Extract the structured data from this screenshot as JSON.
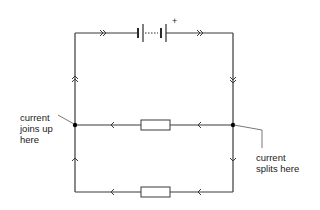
{
  "diagram": {
    "type": "parallel-circuit",
    "battery": {
      "polarity_label": "+"
    },
    "labels": {
      "joins": [
        "current",
        "joins up",
        "here"
      ],
      "splits": [
        "current",
        "splits here"
      ]
    },
    "components": [
      {
        "name": "battery",
        "branch": "main"
      },
      {
        "name": "resistor",
        "branch": "upper-parallel"
      },
      {
        "name": "resistor",
        "branch": "lower-parallel"
      }
    ],
    "current_arrows": {
      "main_wire": "double",
      "parallel_branches": "single"
    },
    "colors": {
      "wire": "#3a3a3a",
      "text": "#1a1a1a",
      "junction": "#000000"
    }
  }
}
